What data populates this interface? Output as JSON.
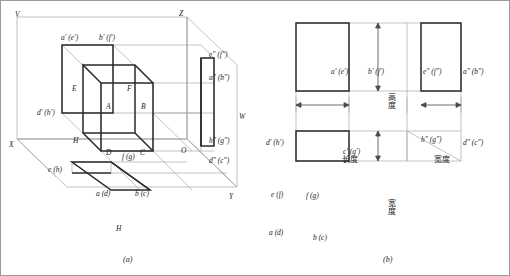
{
  "figure": {
    "caption_a": "(a)",
    "caption_b": "(b)",
    "border_color": "#9a9a9a"
  },
  "colors": {
    "heavy_line": "#2a2a2a",
    "light_line": "#9e9e9e",
    "plane_line": "#b0b0b0",
    "text": "#1e1e1e"
  },
  "panel_a": {
    "title": "three-projection-plane-pictorial",
    "axes": {
      "V": "V",
      "Z": "Z",
      "W": "W",
      "X": "X",
      "Y": "Y",
      "H": "H",
      "O": "O"
    },
    "solid_vertices": {
      "A": "A",
      "B": "B",
      "C": "C",
      "D": "D",
      "E": "E",
      "F": "F",
      "H": "H"
    },
    "front_projection_labels": [
      "a′ (e′)",
      "b′ (f′)",
      "d′ (h′)"
    ],
    "side_projection_labels": [
      "e″ (f″)",
      "a″ (b″)",
      "h″ (g″)",
      "d″ (c″)"
    ],
    "top_projection_labels": [
      "e (h)",
      "f (g)",
      "a (d)",
      "b (c)"
    ]
  },
  "panel_b": {
    "title": "three-view-layout",
    "front_view": {
      "top_left": "a′ (e′)",
      "top_right": "b′ (f′)",
      "bottom_left": "d′ (h′)",
      "bottom_right": "c′ (g′)"
    },
    "side_view": {
      "top_left": "e″ (f″)",
      "top_right": "a″ (b″)",
      "bottom_left": "h″ (g″)",
      "bottom_right": "d″ (c″)"
    },
    "top_view": {
      "top_left": "e (f)",
      "inner": "f (g)",
      "bottom_left": "a (d)",
      "bottom_edge": "b (c)"
    },
    "dimensions": {
      "height": "高度",
      "length": "长度",
      "width_right": "宽度",
      "width_bottom": "宽度"
    }
  }
}
